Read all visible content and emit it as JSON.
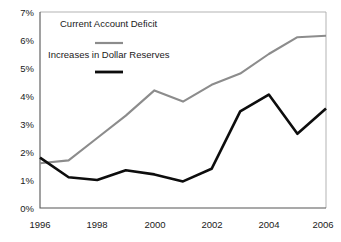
{
  "chart_data": {
    "type": "line",
    "title": "",
    "xlabel": "",
    "ylabel": "",
    "x": [
      1996,
      1997,
      1998,
      1999,
      2000,
      2001,
      2002,
      2003,
      2004,
      2005,
      2006
    ],
    "xtick_labels": [
      "1996",
      "1998",
      "2000",
      "2002",
      "2004",
      "2006"
    ],
    "xticks": [
      1996,
      1998,
      2000,
      2002,
      2004,
      2006
    ],
    "ytick_labels": [
      "0%",
      "1%",
      "2%",
      "3%",
      "4%",
      "5%",
      "6%",
      "7%"
    ],
    "yticks": [
      0,
      1,
      2,
      3,
      4,
      5,
      6,
      7
    ],
    "xlim": [
      1996,
      2006
    ],
    "ylim": [
      0,
      7
    ],
    "grid": false,
    "legend_position": "upper-left-inside",
    "series": [
      {
        "name": "Current Account Deficit",
        "color": "#8c8c8c",
        "values": [
          1.6,
          1.7,
          2.5,
          3.3,
          4.2,
          3.8,
          4.4,
          4.8,
          5.5,
          6.1,
          6.15
        ]
      },
      {
        "name": "Increases in Dollar Reserves",
        "color": "#0d0d0d",
        "values": [
          1.8,
          1.1,
          1.0,
          1.35,
          1.2,
          0.95,
          1.4,
          3.45,
          4.05,
          2.65,
          3.55
        ]
      }
    ]
  },
  "legend": {
    "entries": [
      {
        "label": "Current Account Deficit",
        "color": "#8c8c8c"
      },
      {
        "label": "Increases in Dollar Reserves",
        "color": "#0d0d0d"
      }
    ]
  },
  "axis": {
    "y_labels": [
      "7%",
      "6%",
      "5%",
      "4%",
      "3%",
      "2%",
      "1%",
      "0%"
    ],
    "x_labels": [
      "1996",
      "1998",
      "2000",
      "2002",
      "2004",
      "2006"
    ]
  }
}
